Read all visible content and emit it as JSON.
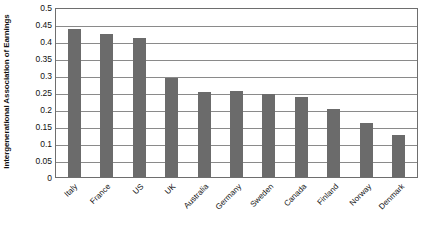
{
  "chart_data": {
    "type": "bar",
    "title": "",
    "subtitle": "",
    "xlabel": "",
    "ylabel": "Intergenerational Association of Earnings",
    "ylim": [
      0,
      0.5
    ],
    "ytick_labels": [
      "0.5",
      "0.45",
      "0.4",
      "0.35",
      "0.3",
      "0.25",
      "0.2",
      "0.15",
      "0.1",
      "0.05",
      "0"
    ],
    "ytick_values": [
      0.5,
      0.45,
      0.4,
      0.35,
      0.3,
      0.25,
      0.2,
      0.15,
      0.1,
      0.05,
      0
    ],
    "grid": true,
    "grid_axis": "y",
    "legend": false,
    "legend_position": "none",
    "bar_color": "#6b6b6b",
    "axis_color": "#6e6e6e",
    "gridline_color": "#8a8a8a",
    "categories": [
      "Italy",
      "France",
      "US",
      "UK",
      "Australia",
      "Germany",
      "Sweden",
      "Canada",
      "Finland",
      "Norway",
      "Denmark"
    ],
    "values": [
      0.435,
      0.42,
      0.41,
      0.29,
      0.25,
      0.252,
      0.243,
      0.235,
      0.2,
      0.16,
      0.125
    ],
    "series": [
      {
        "name": "Intergenerational Association of Earnings",
        "values": [
          0.435,
          0.42,
          0.41,
          0.29,
          0.25,
          0.252,
          0.243,
          0.235,
          0.2,
          0.16,
          0.125
        ]
      }
    ]
  }
}
